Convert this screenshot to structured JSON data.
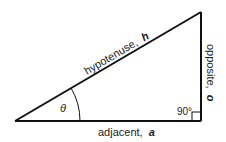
{
  "diagram": {
    "type": "right-triangle",
    "labels": {
      "hypotenuse": "hypotenuse,",
      "hypotenuse_var": "h",
      "opposite": "opposite,",
      "opposite_var": "o",
      "adjacent": "adjacent,",
      "adjacent_var": "a",
      "angle": "θ",
      "right_angle": "90°"
    },
    "colors": {
      "line": "#111111",
      "text": "#222222",
      "background": "#ffffff"
    }
  }
}
